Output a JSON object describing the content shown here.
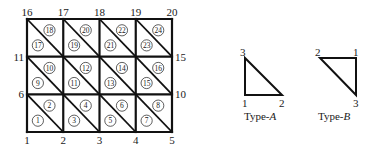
{
  "mesh": {
    "columns": 4,
    "rows": 3,
    "bounds": {
      "x0": 27,
      "y0": 19,
      "x1": 172,
      "y1": 132
    },
    "node_labels": {
      "bottom": [
        "1",
        "2",
        "3",
        "4",
        "5"
      ],
      "top": [
        "16",
        "17",
        "18",
        "19",
        "20"
      ],
      "left": [
        "6",
        "11"
      ],
      "right": [
        "10",
        "15"
      ]
    },
    "elements": [
      {
        "row": 0,
        "col": 0,
        "lower": "1",
        "upper": "2"
      },
      {
        "row": 0,
        "col": 1,
        "lower": "3",
        "upper": "4"
      },
      {
        "row": 0,
        "col": 2,
        "lower": "5",
        "upper": "6"
      },
      {
        "row": 0,
        "col": 3,
        "lower": "7",
        "upper": "8"
      },
      {
        "row": 1,
        "col": 0,
        "lower": "9",
        "upper": "10"
      },
      {
        "row": 1,
        "col": 1,
        "lower": "11",
        "upper": "12"
      },
      {
        "row": 1,
        "col": 2,
        "lower": "13",
        "upper": "14"
      },
      {
        "row": 1,
        "col": 3,
        "lower": "15",
        "upper": "16"
      },
      {
        "row": 2,
        "col": 0,
        "lower": "17",
        "upper": "18"
      },
      {
        "row": 2,
        "col": 1,
        "lower": "19",
        "upper": "20"
      },
      {
        "row": 2,
        "col": 2,
        "lower": "21",
        "upper": "22"
      },
      {
        "row": 2,
        "col": 3,
        "lower": "23",
        "upper": "24"
      }
    ]
  },
  "legend": {
    "type_a": {
      "caption_prefix": "Type-",
      "caption_letter": "A",
      "vertex_labels": {
        "top": "3",
        "bottom_left": "1",
        "bottom_right": "2"
      }
    },
    "type_b": {
      "caption_prefix": "Type-",
      "caption_letter": "B",
      "vertex_labels": {
        "top_left": "2",
        "top_right": "1",
        "bottom_right": "3"
      }
    }
  }
}
